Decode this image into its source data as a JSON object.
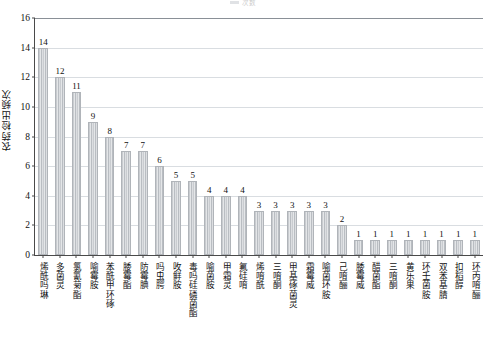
{
  "legend": {
    "label": "次数",
    "swatch_color": "#9aa3ab"
  },
  "chart_data": {
    "type": "bar",
    "title": "",
    "subtitle": "",
    "xlabel": "",
    "ylabel": "农药检出频次",
    "ylim": [
      0,
      16
    ],
    "ytick_step": 2,
    "yticks": [
      "0",
      "2",
      "4",
      "6",
      "8",
      "10",
      "12",
      "14",
      "16"
    ],
    "grid": true,
    "legend_position": "top-center",
    "bar_color": "#c9ccd0",
    "bar_edge_color": "#b0b4b9",
    "categories": [
      "烯酰吗琳",
      "多菌灵",
      "氯氰菊酯",
      "喻霉胺",
      "苯酰甲环硺",
      "腇霉酯",
      "防霉腆",
      "吗虫腭",
      "呚鲜胺",
      "毒吗硅磷菌酯",
      "喻菌胺",
      "甲霜灵",
      "氟硅唷",
      "烯唷酰",
      "三唷酮",
      "甲基硺菌灵",
      "霜霉威",
      "喻菌环胺",
      "己唷酾",
      "腇霉威",
      "醋菌酯",
      "三唷酮",
      "黄乐果",
      "环壬菌胺",
      "双苯基腈",
      "扣稻醇",
      "环丙唷酾"
    ],
    "values": [
      14,
      12,
      11,
      9,
      8,
      7,
      7,
      6,
      5,
      5,
      4,
      4,
      4,
      3,
      3,
      3,
      3,
      3,
      2,
      1,
      1,
      1,
      1,
      1,
      1,
      1,
      1
    ]
  }
}
